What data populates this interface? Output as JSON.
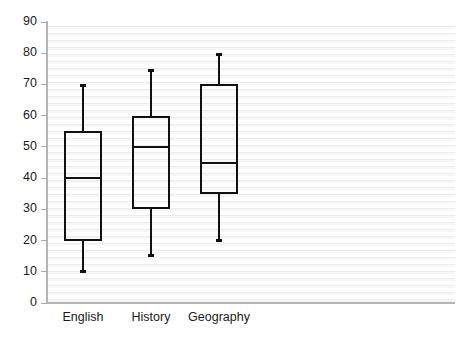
{
  "chart_data": {
    "type": "boxplot",
    "title": "",
    "xlabel": "",
    "ylabel": "",
    "ylim": [
      0,
      90
    ],
    "y_ticks": [
      0,
      10,
      20,
      30,
      40,
      50,
      60,
      70,
      80,
      90
    ],
    "grid": true,
    "legend": "none",
    "categories": [
      "English",
      "History",
      "Geography"
    ],
    "boxes": [
      {
        "category": "English",
        "min": 10,
        "q1": 20,
        "median": 40,
        "q3": 55,
        "max": 70
      },
      {
        "category": "History",
        "min": 15,
        "q1": 30,
        "median": 50,
        "q3": 60,
        "max": 75
      },
      {
        "category": "Geography",
        "min": 20,
        "q1": 35,
        "median": 45,
        "q3": 70,
        "max": 80
      }
    ],
    "colors": {
      "box_stroke": "#111111",
      "whisker": "#111111",
      "axis": "#b4b4b4",
      "gridline": "#ececec",
      "background": "#ffffff",
      "text": "#1a1a1a"
    }
  }
}
